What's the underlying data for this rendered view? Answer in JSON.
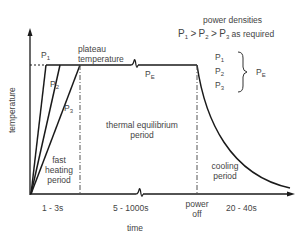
{
  "diagram": {
    "axes": {
      "y_label": "temperature",
      "x_label": "time"
    },
    "curves": [
      {
        "label": "P",
        "sub": "1"
      },
      {
        "label": "P",
        "sub": "2"
      },
      {
        "label": "P",
        "sub": "3"
      }
    ],
    "plateau_label_line1": "plateau",
    "plateau_label_line2": "temperature",
    "plateau_power": {
      "label": "P",
      "sub": "E"
    },
    "legend": {
      "title": "power densities",
      "relation": {
        "p1": "P",
        "p1_sub": "1",
        "gt1": ">",
        "p2": "P",
        "p2_sub": "2",
        "gt2": ">",
        "p3": "P",
        "p3_sub": "3",
        "suffix": "as required"
      },
      "items": [
        {
          "label": "P",
          "sub": "1"
        },
        {
          "label": "P",
          "sub": "2"
        },
        {
          "label": "P",
          "sub": "3"
        }
      ],
      "brace_target": {
        "label": "P",
        "sub": "E"
      }
    },
    "periods": {
      "fast_heating": [
        "fast",
        "heating",
        "period"
      ],
      "equilibrium": [
        "thermal equilibrium",
        "period"
      ],
      "cooling": [
        "cooling",
        "period"
      ]
    },
    "time_ticks": {
      "heating": "1 - 3s",
      "equilibrium": "5 - 1000s",
      "power_off": [
        "power",
        "off"
      ],
      "cooling": "20 - 40s"
    },
    "colors": {
      "line": "#1a1a1a",
      "text": "#444444",
      "background": "#ffffff"
    }
  }
}
